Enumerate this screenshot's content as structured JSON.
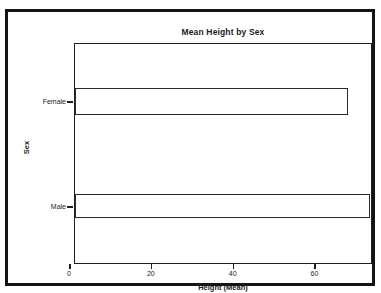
{
  "chart_data": {
    "type": "bar",
    "orientation": "horizontal",
    "title": "Mean Height by Sex",
    "xlabel": "Height (Mean)",
    "ylabel": "Sex",
    "categories": [
      "Female",
      "Male"
    ],
    "values": [
      66.8,
      72.1
    ],
    "series": [
      {
        "name": "Height (Mean)",
        "values": [
          66.8,
          72.1
        ]
      }
    ],
    "xlim": [
      0,
      72.1
    ],
    "xticks": [
      0,
      20,
      40,
      60
    ],
    "xtick_labels": [
      "0",
      "20",
      "40",
      "60"
    ],
    "ytick_labels": [
      "Female",
      "Male"
    ],
    "grid": false,
    "legend": "none",
    "bar_fill": "#ffffff",
    "bar_edge_color": "#2a2a2a",
    "frame_color": "#141414",
    "background": "#ffffff"
  },
  "figure": {
    "title": "Mean Height by Sex",
    "x_axis": {
      "title": "Height (Mean)",
      "ticks": [
        "0",
        "20",
        "40",
        "60"
      ]
    },
    "y_axis": {
      "title": "Sex",
      "ticks": [
        "Female",
        "Male"
      ]
    }
  }
}
